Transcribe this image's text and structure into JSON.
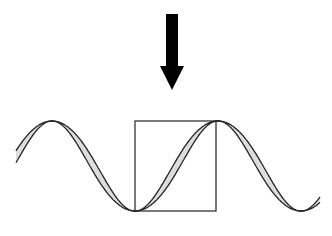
{
  "diagram": {
    "colors": {
      "background": "#ffffff",
      "stroke": "#222222",
      "ribbon_fill": "#dddddd",
      "arrow": "#000000"
    },
    "arrow": {
      "x": 172,
      "y_start": 14,
      "y_end": 90,
      "shaft_width": 12,
      "head_width": 24,
      "head_height": 24,
      "direction": "down"
    },
    "wave": {
      "peaks_x": [
        52,
        216
      ],
      "troughs_x": [
        135,
        297
      ],
      "y_top": 121,
      "y_bottom": 211,
      "x_start": 16,
      "x_end": 320
    },
    "box": {
      "x": 135,
      "y": 121,
      "width": 81,
      "height": 90
    }
  }
}
